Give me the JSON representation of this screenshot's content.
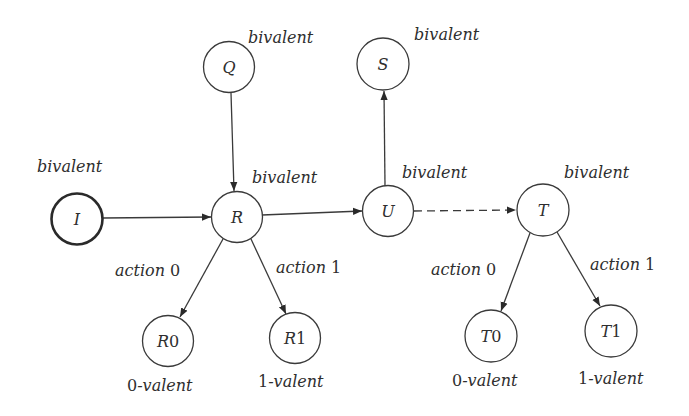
{
  "diagram": {
    "nodes": [
      {
        "id": "I",
        "label": "I",
        "state": "bivalent",
        "initial": true
      },
      {
        "id": "Q",
        "label": "Q",
        "state": "bivalent"
      },
      {
        "id": "R",
        "label": "R",
        "state": "bivalent"
      },
      {
        "id": "S",
        "label": "S",
        "state": "bivalent"
      },
      {
        "id": "U",
        "label": "U",
        "state": "bivalent"
      },
      {
        "id": "T",
        "label": "T",
        "state": "bivalent"
      },
      {
        "id": "R0",
        "label_letter": "R",
        "label_digit": "0",
        "state_digit": "0",
        "state_suffix": "-valent"
      },
      {
        "id": "R1",
        "label_letter": "R",
        "label_digit": "1",
        "state_digit": "1",
        "state_suffix": "-valent"
      },
      {
        "id": "T0",
        "label_letter": "T",
        "label_digit": "0",
        "state_digit": "0",
        "state_suffix": "-valent"
      },
      {
        "id": "T1",
        "label_letter": "T",
        "label_digit": "1",
        "state_digit": "1",
        "state_suffix": "-valent"
      }
    ],
    "edges": [
      {
        "from": "I",
        "to": "R",
        "style": "solid"
      },
      {
        "from": "Q",
        "to": "R",
        "style": "solid"
      },
      {
        "from": "R",
        "to": "U",
        "style": "solid"
      },
      {
        "from": "U",
        "to": "S",
        "style": "solid"
      },
      {
        "from": "U",
        "to": "T",
        "style": "dashed"
      },
      {
        "from": "R",
        "to": "R0",
        "style": "solid",
        "label_word": "action",
        "label_digit": "0"
      },
      {
        "from": "R",
        "to": "R1",
        "style": "solid",
        "label_word": "action",
        "label_digit": "1"
      },
      {
        "from": "T",
        "to": "T0",
        "style": "solid",
        "label_word": "action",
        "label_digit": "0"
      },
      {
        "from": "T",
        "to": "T1",
        "style": "solid",
        "label_word": "action",
        "label_digit": "1"
      }
    ]
  }
}
